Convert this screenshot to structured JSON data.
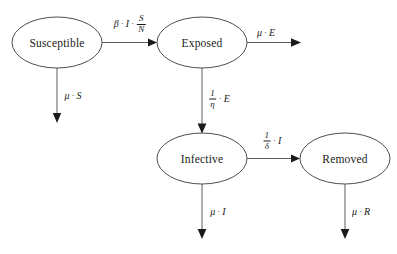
{
  "diagram": {
    "type": "state-transition",
    "model": "SEIR compartmental model",
    "nodes": [
      {
        "id": "susceptible",
        "label": "Susceptible",
        "cx": 57,
        "cy": 42.5,
        "rx": 45,
        "ry": 25.5
      },
      {
        "id": "exposed",
        "label": "Exposed",
        "cx": 202,
        "cy": 42.5,
        "rx": 45,
        "ry": 25.5
      },
      {
        "id": "infective",
        "label": "Infective",
        "cx": 202,
        "cy": 158.5,
        "rx": 45,
        "ry": 25.5
      },
      {
        "id": "removed",
        "label": "Removed",
        "cx": 345,
        "cy": 158.5,
        "rx": 45,
        "ry": 25.5
      }
    ],
    "edges": [
      {
        "id": "susceptible-to-exposed",
        "from": "susceptible",
        "to": "exposed",
        "orientation": "horizontal",
        "label": {
          "lead": "β",
          "mid": "I",
          "frac_num": "S",
          "frac_den": "N"
        },
        "label_x": 130,
        "label_y": 24
      },
      {
        "id": "susceptible-death",
        "from": "susceptible",
        "to": "outflow",
        "orientation": "vertical",
        "label": {
          "lead": "μ",
          "tail": "S"
        },
        "label_x": 73,
        "label_y": 96
      },
      {
        "id": "exposed-death",
        "from": "exposed",
        "to": "outflow",
        "orientation": "horizontal",
        "label": {
          "lead": "μ",
          "tail": "E"
        },
        "label_x": 266,
        "label_y": 33
      },
      {
        "id": "exposed-to-infective",
        "from": "exposed",
        "to": "infective",
        "orientation": "vertical",
        "label": {
          "frac_num": "1",
          "frac_den": "η",
          "tail": "E"
        },
        "label_x": 219,
        "label_y": 98
      },
      {
        "id": "infective-to-removed",
        "from": "infective",
        "to": "removed",
        "orientation": "horizontal",
        "label": {
          "frac_num": "1",
          "frac_den": "δ",
          "tail": "I"
        },
        "label_x": 272,
        "label_y": 140
      },
      {
        "id": "infective-death",
        "from": "infective",
        "to": "outflow",
        "orientation": "vertical",
        "label": {
          "lead": "μ",
          "tail": "I"
        },
        "label_x": 218,
        "label_y": 212
      },
      {
        "id": "removed-death",
        "from": "removed",
        "to": "outflow",
        "orientation": "vertical",
        "label": {
          "lead": "μ",
          "tail": "R"
        },
        "label_x": 361,
        "label_y": 212
      }
    ],
    "separator": "·",
    "colors": {
      "node_stroke": "#3a3a3a",
      "edge_stroke": "#4a4a4a",
      "arrow_fill": "#1a1a1a",
      "text": "#1a1a1a",
      "background": "#ffffff"
    }
  }
}
